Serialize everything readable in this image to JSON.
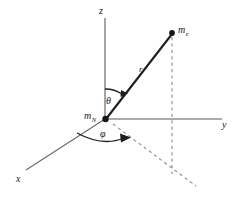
{
  "figure": {
    "background_color": "#ffffff",
    "line_color": "#2b2b2b",
    "axis_color": "#555555",
    "dash_color": "#8a8a8a"
  },
  "axes": {
    "z": {
      "label": "z",
      "label_x": 99,
      "label_y": 14,
      "x1": 105,
      "y1": 18,
      "x2": 105,
      "y2": 119
    },
    "y": {
      "label": "y",
      "label_x": 222,
      "label_y": 128,
      "x1": 105,
      "y1": 119,
      "x2": 222,
      "y2": 119
    },
    "x": {
      "label": "x",
      "label_x": 16,
      "label_y": 182,
      "x1": 105,
      "y1": 119,
      "x2": 26,
      "y2": 170
    }
  },
  "points": {
    "origin": {
      "label": "m",
      "subscript": "N",
      "label_x": 85,
      "label_y": 119,
      "x": 105,
      "y": 119
    },
    "particle": {
      "label": "m",
      "subscript": "e",
      "label_x": 178,
      "label_y": 33,
      "x": 172,
      "y": 33
    },
    "projection": {
      "x": 172,
      "y": 172
    }
  },
  "vectors": {
    "radius": {
      "label": "r",
      "label_x": 139,
      "label_y": 72
    }
  },
  "angles": {
    "theta": {
      "label": "θ",
      "label_x": 107,
      "label_y": 103,
      "description": "polar angle from z-axis to r"
    },
    "phi": {
      "label": "φ",
      "label_x": 101,
      "label_y": 137,
      "description": "azimuthal angle from x-axis in xy-plane"
    }
  },
  "dashed_lines": {
    "vertical_drop": {
      "x1": 172,
      "y1": 37,
      "x2": 172,
      "y2": 174
    },
    "ground_projection": {
      "x1": 113,
      "y1": 124,
      "x2": 196,
      "y2": 186
    }
  }
}
